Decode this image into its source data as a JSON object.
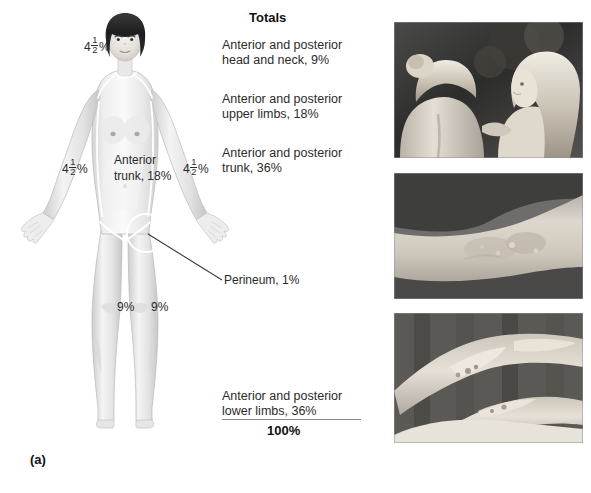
{
  "figure": {
    "panel_a_caption": "(a)",
    "panel_b_caption": "(b)"
  },
  "totals": {
    "title": "Totals",
    "items": [
      "Anterior and posterior\nhead and neck, 9%",
      "Anterior and posterior\nupper limbs, 18%",
      "Anterior and posterior\ntrunk, 36%",
      "Anterior and posterior\nlower limbs, 36%"
    ],
    "grand_total": "100%"
  },
  "body_labels": {
    "head": {
      "whole": "4",
      "numerator": "1",
      "denominator": "2",
      "unit": "%"
    },
    "arm_left": {
      "whole": "4",
      "numerator": "1",
      "denominator": "2",
      "unit": "%"
    },
    "arm_right": {
      "whole": "4",
      "numerator": "1",
      "denominator": "2",
      "unit": "%"
    },
    "trunk": "Anterior\ntrunk, 18%",
    "leg_left": "9%",
    "leg_right": "9%",
    "perineum": "Perineum, 1%"
  },
  "photos": [
    {
      "name": "two-children-backs-photo",
      "alt": "Two fair-haired children seen from behind, outdoors"
    },
    {
      "name": "limb-closeup-photo",
      "alt": "Close-up of a limb with healing burn scarring"
    },
    {
      "name": "legs-dressing-photo",
      "alt": "Legs with burn injury and dressings"
    }
  ],
  "colors": {
    "text": "#2b2b2b",
    "rule": "#8a8a8a",
    "skin_light": "#f2f2f2",
    "skin_shade": "#d8d8d8",
    "hair_dark": "#272727"
  }
}
